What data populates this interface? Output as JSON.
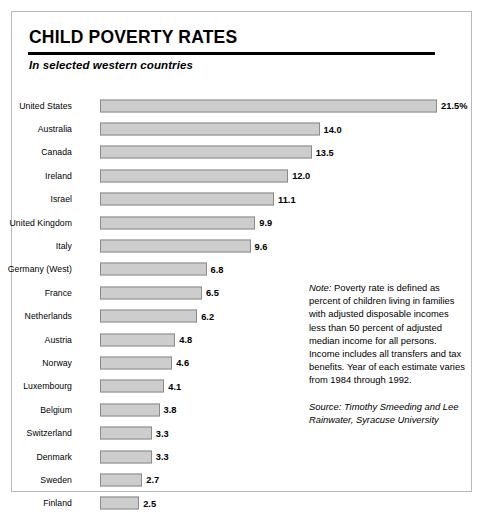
{
  "header": {
    "title": "CHILD POVERTY RATES",
    "subtitle": "In selected western countries"
  },
  "note": {
    "lead": "Note:",
    "body": " Poverty rate is defined as percent of children living in families with adjusted disposable incomes less than 50 percent of adjusted median income for all persons. Income includes all transfers and tax benefits.  Year of each estimate varies from 1984 through 1992.",
    "source": "Source: Timothy Smeeding and Lee Rainwater, Syracuse University"
  },
  "chart_data": {
    "type": "bar",
    "orientation": "horizontal",
    "title": "CHILD POVERTY RATES",
    "subtitle": "In selected western countries",
    "xlabel": "",
    "ylabel": "",
    "xlim": [
      0,
      21.5
    ],
    "grid": false,
    "legend": null,
    "value_unit": "percent",
    "bar_color": "#cdcdcd",
    "bar_border_color": "#8a8a8a",
    "categories": [
      "United States",
      "Australia",
      "Canada",
      "Ireland",
      "Israel",
      "United Kingdom",
      "Italy",
      "Germany (West)",
      "France",
      "Netherlands",
      "Austria",
      "Norway",
      "Luxembourg",
      "Belgium",
      "Switzerland",
      "Denmark",
      "Sweden",
      "Finland"
    ],
    "values": [
      21.5,
      14.0,
      13.5,
      12.0,
      11.1,
      9.9,
      9.6,
      6.8,
      6.5,
      6.2,
      4.8,
      4.6,
      4.1,
      3.8,
      3.3,
      3.3,
      2.7,
      2.5
    ],
    "value_labels": [
      "21.5%",
      "14.0",
      "13.5",
      "12.0",
      "11.1",
      "9.9",
      "9.6",
      "6.8",
      "6.5",
      "6.2",
      "4.8",
      "4.6",
      "4.1",
      "3.8",
      "3.3",
      "3.3",
      "2.7",
      "2.5"
    ]
  }
}
